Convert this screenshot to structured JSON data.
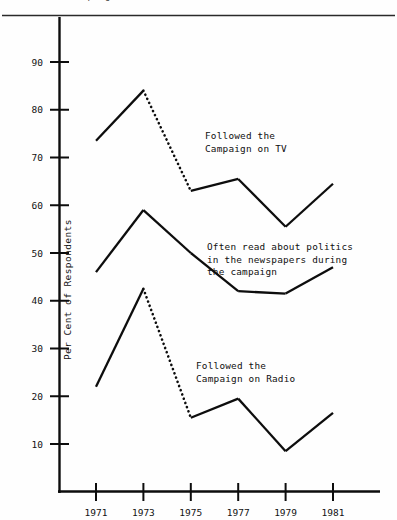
{
  "figure": {
    "clipped_title": "Campaign, 1971-81",
    "ylabel": "Per Cent of Respondents"
  },
  "chart_data": {
    "type": "line",
    "title": "Campaign, 1971-81",
    "xlabel": "",
    "ylabel": "Per Cent of Respondents",
    "x": [
      1971,
      1973,
      1975,
      1977,
      1979,
      1981
    ],
    "xtick_labels": [
      "1971",
      "1973",
      "1975",
      "1977",
      "1979",
      "1981"
    ],
    "ytick_labels": [
      "10",
      "20",
      "30",
      "40",
      "50",
      "60",
      "70",
      "80",
      "90"
    ],
    "yticks": [
      10,
      20,
      30,
      40,
      50,
      60,
      70,
      80,
      90
    ],
    "ylim": [
      0,
      95
    ],
    "xlim": [
      1970.2,
      1982.2
    ],
    "grid": false,
    "legend": "annotations-inline",
    "line_color": "#0d0d0d",
    "series": [
      {
        "name": "Followed the Campaign on TV",
        "values": [
          73.5,
          84.0,
          63.0,
          65.5,
          55.5,
          64.5
        ],
        "dotted_segment": [
          1973,
          1975
        ]
      },
      {
        "name": "Often read about politics in the newspapers during the campaign",
        "values": [
          46.0,
          59.0,
          50.0,
          42.0,
          41.5,
          47.0
        ],
        "dotted_segment": null
      },
      {
        "name": "Followed the Campaign on Radio",
        "values": [
          22.0,
          42.5,
          15.5,
          19.5,
          8.5,
          16.5
        ],
        "dotted_segment": [
          1973,
          1975
        ]
      }
    ],
    "annotations": [
      {
        "id": "tv",
        "lines": [
          "Followed the",
          "Campaign on TV"
        ],
        "x": 205,
        "y": 139
      },
      {
        "id": "newspapers",
        "lines": [
          "Often read about politics",
          "in the newspapers during",
          "the campaign"
        ],
        "x": 207,
        "y": 250
      },
      {
        "id": "radio",
        "lines": [
          "Followed the",
          "Campaign on Radio"
        ],
        "x": 196,
        "y": 369
      }
    ]
  }
}
